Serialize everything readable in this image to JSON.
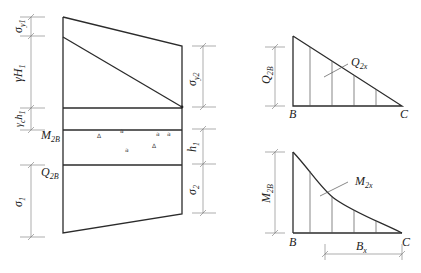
{
  "figure": {
    "type": "structural load diagram",
    "left_panel": {
      "name": "earth pressure distribution on wall",
      "left_dimensions": [
        {
          "main": "σ",
          "sub": "y1"
        },
        {
          "main": "γH",
          "sub": "1"
        },
        {
          "main": "γ",
          "sub": "c",
          "tail": "h",
          "tail_sub": "1"
        },
        {
          "main": "σ",
          "sub": "1"
        }
      ],
      "section_labels": [
        {
          "main": "M",
          "sub": "2B"
        },
        {
          "main": "Q",
          "sub": "2B"
        }
      ],
      "right_dimensions": [
        {
          "main": "σ",
          "sub": "y2"
        },
        {
          "main": "h",
          "sub": "1"
        },
        {
          "main": "σ",
          "sub": "2"
        }
      ],
      "aggregate_symbols": [
        "Δ",
        "a",
        "a",
        "a",
        "Δ",
        "a"
      ]
    },
    "top_right_panel": {
      "name": "shear force diagram",
      "dimension": {
        "main": "Q",
        "sub": "2B"
      },
      "curve_label": {
        "main": "Q",
        "sub": "2x"
      },
      "points": {
        "left": "B",
        "right": "C"
      }
    },
    "bottom_right_panel": {
      "name": "bending moment diagram",
      "dimension": {
        "main": "M",
        "sub": "2B"
      },
      "curve_label": {
        "main": "M",
        "sub": "2x"
      },
      "points": {
        "left": "B",
        "right": "C"
      },
      "span_dimension": {
        "main": "B",
        "sub": "x"
      }
    }
  }
}
